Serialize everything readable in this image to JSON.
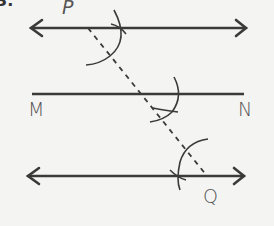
{
  "diagram": {
    "labels": {
      "corner": "3.",
      "P": "P",
      "M": "M",
      "N": "N",
      "Q": "Q"
    },
    "colors": {
      "line": "#3a3a3a",
      "label": "#555555",
      "background": "#f4f4f2"
    },
    "elements": [
      {
        "type": "line-with-arrows",
        "name": "top-parallel-line",
        "through": "P"
      },
      {
        "type": "segment",
        "name": "line-MN",
        "endpoints": [
          "M",
          "N"
        ]
      },
      {
        "type": "line-with-arrows",
        "name": "bottom-parallel-line",
        "through": "Q"
      },
      {
        "type": "dashed-transversal",
        "from": "P",
        "to": "Q"
      },
      {
        "type": "construction-arcs",
        "count": 4
      }
    ]
  }
}
